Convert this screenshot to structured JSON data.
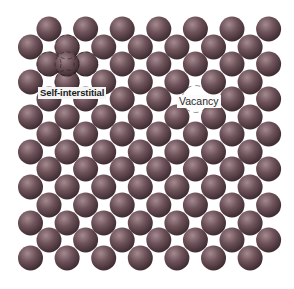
{
  "figure": {
    "type": "crystal-lattice-point-defects",
    "background": "#ffffff",
    "atom": {
      "radius": 12.5,
      "color_highlight": "#a48a90",
      "color_mid": "#6e5259",
      "color_edge": "#35252a"
    },
    "lattice": {
      "rows_a": {
        "x0": 49,
        "dx": 36.6,
        "count": 7,
        "y": [
          29,
          64,
          99,
          134,
          169,
          205,
          240
        ]
      },
      "rows_b": {
        "x0": 30.5,
        "dx": 36.6,
        "count": 7,
        "y": [
          47,
          82,
          117,
          152,
          187,
          223,
          258
        ]
      }
    },
    "defects": {
      "vacancy": {
        "x": 195.5,
        "y": 99,
        "label": "Vacancy"
      },
      "self_interstitial": {
        "x": 67,
        "y": 64,
        "label": "Self-interstitial"
      }
    }
  },
  "labels": {
    "self_interstitial": "Self-interstitial",
    "vacancy": "Vacancy"
  }
}
